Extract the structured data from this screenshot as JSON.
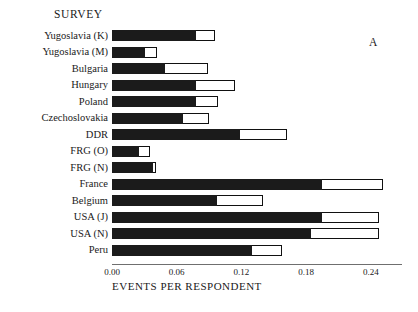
{
  "header": {
    "survey_label": "SURVEY",
    "panel_letter": "A"
  },
  "axis": {
    "xlabel": "EVENTS PER RESPONDENT",
    "ticks": [
      "0.00",
      "0.06",
      "0.12",
      "0.18",
      "0.24"
    ]
  },
  "chart_data": {
    "type": "bar",
    "orientation": "horizontal",
    "title": "SURVEY",
    "annotation": "A",
    "xlabel": "EVENTS PER RESPONDENT",
    "ylabel": "",
    "xlim": [
      0.0,
      0.2679
    ],
    "xticks": [
      0.0,
      0.06,
      0.12,
      0.18,
      0.24
    ],
    "grid": false,
    "legend": "none",
    "categories": [
      "Yugoslavia (K)",
      "Yugoslavia (M)",
      "Bulgaria",
      "Hungary",
      "Poland",
      "Czechoslovakia",
      "DDR",
      "FRG (O)",
      "FRG (N)",
      "France",
      "Belgium",
      "USA (J)",
      "USA (N)",
      "Peru"
    ],
    "series": [
      {
        "name": "filled (solid black)",
        "color": "#1b1b1b",
        "values": [
          0.078,
          0.031,
          0.049,
          0.078,
          0.078,
          0.066,
          0.119,
          0.025,
          0.038,
          0.195,
          0.097,
          0.195,
          0.184,
          0.13
        ]
      },
      {
        "name": "total (outlined)",
        "color": "#ffffff",
        "values": [
          0.095,
          0.042,
          0.089,
          0.114,
          0.098,
          0.09,
          0.162,
          0.035,
          0.041,
          0.251,
          0.14,
          0.247,
          0.247,
          0.158
        ]
      }
    ]
  }
}
